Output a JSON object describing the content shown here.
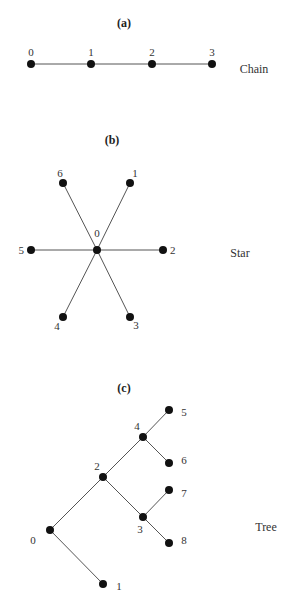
{
  "panels": [
    {
      "id": "a",
      "title": "(a)",
      "name": "Chain",
      "nodes": [
        {
          "id": "0",
          "x": 31,
          "y": 64,
          "lx": 31,
          "ly": 56,
          "anchor": "middle"
        },
        {
          "id": "1",
          "x": 91,
          "y": 64,
          "lx": 91,
          "ly": 56,
          "anchor": "middle"
        },
        {
          "id": "2",
          "x": 152,
          "y": 64,
          "lx": 152,
          "ly": 56,
          "anchor": "middle"
        },
        {
          "id": "3",
          "x": 212,
          "y": 64,
          "lx": 212,
          "ly": 56,
          "anchor": "middle"
        }
      ],
      "edges": [
        [
          "0",
          "1"
        ],
        [
          "1",
          "2"
        ],
        [
          "2",
          "3"
        ]
      ],
      "title_pos": {
        "x": 124,
        "y": 27
      },
      "name_pos": {
        "x": 254,
        "y": 73
      }
    },
    {
      "id": "b",
      "title": "(b)",
      "name": "Star",
      "nodes": [
        {
          "id": "0",
          "x": 97,
          "y": 250,
          "lx": 97,
          "ly": 237,
          "anchor": "middle"
        },
        {
          "id": "1",
          "x": 130,
          "y": 183,
          "lx": 135,
          "ly": 177,
          "anchor": "middle"
        },
        {
          "id": "2",
          "x": 163,
          "y": 250,
          "lx": 170,
          "ly": 254,
          "anchor": "start"
        },
        {
          "id": "3",
          "x": 130,
          "y": 317,
          "lx": 136,
          "ly": 329,
          "anchor": "middle"
        },
        {
          "id": "4",
          "x": 63,
          "y": 317,
          "lx": 57,
          "ly": 330,
          "anchor": "middle"
        },
        {
          "id": "5",
          "x": 31,
          "y": 250,
          "lx": 24,
          "ly": 254,
          "anchor": "end"
        },
        {
          "id": "6",
          "x": 63,
          "y": 183,
          "lx": 60,
          "ly": 177,
          "anchor": "middle"
        }
      ],
      "edges": [
        [
          "0",
          "1"
        ],
        [
          "0",
          "2"
        ],
        [
          "0",
          "3"
        ],
        [
          "0",
          "4"
        ],
        [
          "0",
          "5"
        ],
        [
          "0",
          "6"
        ]
      ],
      "title_pos": {
        "x": 112,
        "y": 144
      },
      "name_pos": {
        "x": 240,
        "y": 257
      }
    },
    {
      "id": "c",
      "title": "(c)",
      "name": "Tree",
      "nodes": [
        {
          "id": "0",
          "x": 50,
          "y": 530,
          "lx": 33,
          "ly": 544,
          "anchor": "middle"
        },
        {
          "id": "1",
          "x": 103,
          "y": 584,
          "lx": 119,
          "ly": 590,
          "anchor": "middle"
        },
        {
          "id": "2",
          "x": 103,
          "y": 477,
          "lx": 97,
          "ly": 470,
          "anchor": "middle"
        },
        {
          "id": "3",
          "x": 143,
          "y": 517,
          "lx": 140,
          "ly": 533,
          "anchor": "middle"
        },
        {
          "id": "4",
          "x": 143,
          "y": 437,
          "lx": 137,
          "ly": 430,
          "anchor": "middle"
        },
        {
          "id": "5",
          "x": 169,
          "y": 410,
          "lx": 184,
          "ly": 416,
          "anchor": "middle"
        },
        {
          "id": "6",
          "x": 169,
          "y": 463,
          "lx": 184,
          "ly": 464,
          "anchor": "middle"
        },
        {
          "id": "7",
          "x": 169,
          "y": 490,
          "lx": 184,
          "ly": 497,
          "anchor": "middle"
        },
        {
          "id": "8",
          "x": 169,
          "y": 543,
          "lx": 184,
          "ly": 544,
          "anchor": "middle"
        }
      ],
      "edges": [
        [
          "0",
          "1"
        ],
        [
          "0",
          "2"
        ],
        [
          "2",
          "4"
        ],
        [
          "2",
          "3"
        ],
        [
          "4",
          "5"
        ],
        [
          "4",
          "6"
        ],
        [
          "3",
          "7"
        ],
        [
          "3",
          "8"
        ]
      ],
      "title_pos": {
        "x": 124,
        "y": 392
      },
      "name_pos": {
        "x": 266,
        "y": 531
      }
    }
  ]
}
